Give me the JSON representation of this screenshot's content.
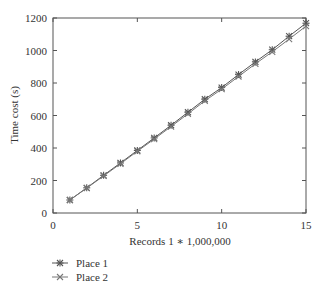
{
  "chart_data": {
    "type": "line",
    "title": "",
    "xlabel": "Records 1 ∗ 1,000,000",
    "ylabel": "Time cost (s)",
    "xlim": [
      0,
      15
    ],
    "ylim": [
      0,
      1200
    ],
    "xticks": [
      0,
      5,
      10,
      15
    ],
    "yticks": [
      0,
      200,
      400,
      600,
      800,
      1000,
      1200
    ],
    "grid": false,
    "legend_position": "below-left",
    "x": [
      1,
      2,
      3,
      4,
      5,
      6,
      7,
      8,
      9,
      10,
      11,
      12,
      13,
      14,
      15
    ],
    "series": [
      {
        "name": "Place 1",
        "marker": "star",
        "color": "#555555",
        "values": [
          80,
          155,
          232,
          308,
          385,
          462,
          540,
          620,
          700,
          772,
          852,
          930,
          1005,
          1088,
          1168
        ]
      },
      {
        "name": "Place 2",
        "marker": "x",
        "color": "#777777",
        "values": [
          80,
          153,
          228,
          303,
          380,
          455,
          532,
          610,
          690,
          762,
          840,
          918,
          992,
          1070,
          1150
        ]
      }
    ]
  }
}
